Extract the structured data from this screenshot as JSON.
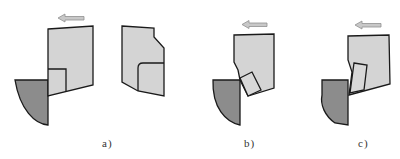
{
  "figure": {
    "colors": {
      "tool_fill": "#d4d4d4",
      "chip_fill": "#d8d8d8",
      "workpiece_fill": "#8c8c8c",
      "outline": "#1a1a1a",
      "arrow_fill": "#c8c8c8",
      "arrow_stroke": "#909090"
    },
    "panels": [
      {
        "id": "a",
        "label": "a)"
      },
      {
        "id": "b",
        "label": "b)"
      },
      {
        "id": "c",
        "label": "c)"
      }
    ]
  }
}
